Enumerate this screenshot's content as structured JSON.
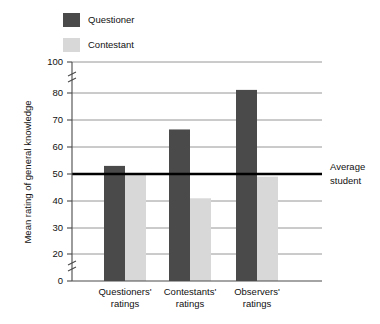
{
  "chart_data": {
    "type": "bar",
    "title": "",
    "subtitle": "",
    "xlabel": "",
    "ylabel": "Mean rating of general knowledge",
    "categories": [
      "Questioners' ratings",
      "Contestants' ratings",
      "Observers' ratings"
    ],
    "category_lines": [
      [
        "Questioners'",
        "ratings"
      ],
      [
        "Contestants'",
        "ratings"
      ],
      [
        "Observers'",
        "ratings"
      ]
    ],
    "series": [
      {
        "name": "Questioner",
        "color": "#4a4a4a",
        "values": [
          53,
          66.5,
          82
        ]
      },
      {
        "name": "Contestant",
        "color": "#d8d8d8",
        "values": [
          50,
          41,
          49
        ]
      }
    ],
    "ylim": [
      0,
      100
    ],
    "ytick_labels": [
      "0",
      "20",
      "30",
      "40",
      "50",
      "60",
      "70",
      "80",
      "100"
    ],
    "ytick_values": [
      0,
      20,
      30,
      40,
      50,
      60,
      70,
      80,
      100
    ],
    "gridlines_at": [
      20,
      30,
      40,
      60,
      70,
      80,
      100
    ],
    "grid": true,
    "axis_breaks": [
      {
        "between": [
          0,
          20
        ]
      },
      {
        "between": [
          80,
          100
        ]
      }
    ],
    "reference_line": {
      "value": 50,
      "label_lines": [
        "Average",
        "student"
      ],
      "label": "Average student",
      "color": "#000000"
    },
    "legend": {
      "position": "top-left",
      "entries": [
        {
          "label": "Questioner",
          "color": "#4a4a4a"
        },
        {
          "label": "Contestant",
          "color": "#d8d8d8"
        }
      ]
    }
  },
  "colors": {
    "questioner": "#4a4a4a",
    "contestant": "#d8d8d8",
    "gridline": "#8a8a8a",
    "reference": "#000000",
    "background": "#ffffff"
  }
}
